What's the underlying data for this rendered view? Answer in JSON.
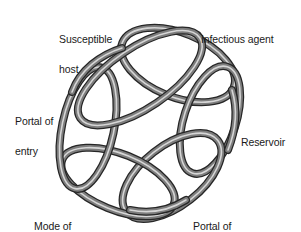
{
  "diagram": {
    "type": "interlocking-loops",
    "colors": {
      "tube_dark": "#2b2b2b",
      "tube_mid": "#7a7a7a",
      "tube_light": "#d8d8d8",
      "background": "#ffffff",
      "text": "#1a1a1a"
    },
    "links": [
      {
        "id": "infectious-agent",
        "line1": "Infectious agent",
        "line2": ""
      },
      {
        "id": "reservoir",
        "line1": "Reservoir",
        "line2": ""
      },
      {
        "id": "portal-of-exit",
        "line1": "Portal of",
        "line2": "exit"
      },
      {
        "id": "mode-of-transmission",
        "line1": "Mode of",
        "line2": "transmission"
      },
      {
        "id": "portal-of-entry",
        "line1": "Portal of",
        "line2": "entry"
      },
      {
        "id": "susceptible-host",
        "line1": "Susceptible",
        "line2": "host"
      }
    ]
  }
}
